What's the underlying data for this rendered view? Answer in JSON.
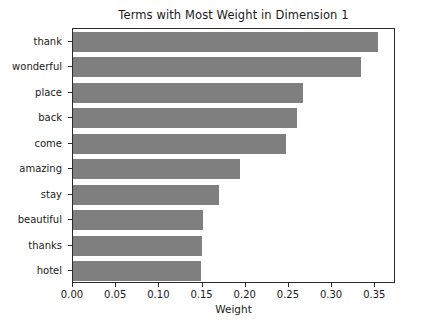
{
  "chart_data": {
    "type": "bar",
    "orientation": "horizontal",
    "title": "Terms with Most Weight in Dimension 1",
    "xlabel": "Weight",
    "ylabel": "",
    "categories": [
      "thank",
      "wonderful",
      "place",
      "back",
      "come",
      "amazing",
      "stay",
      "beautiful",
      "thanks",
      "hotel"
    ],
    "values": [
      0.353,
      0.334,
      0.266,
      0.259,
      0.247,
      0.193,
      0.169,
      0.151,
      0.149,
      0.148
    ],
    "xlim": [
      0.0,
      0.374
    ],
    "xticks": [
      0.0,
      0.05,
      0.1,
      0.15,
      0.2,
      0.25,
      0.3,
      0.35
    ],
    "xtick_labels": [
      "0.00",
      "0.05",
      "0.10",
      "0.15",
      "0.20",
      "0.25",
      "0.30",
      "0.35"
    ],
    "grid": false,
    "legend": null,
    "bar_color": "#7f7f7f",
    "axis_color": "#2b2b2b",
    "background": "#ffffff"
  }
}
